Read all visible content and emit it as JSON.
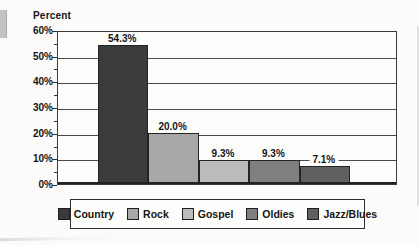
{
  "chart_data": {
    "type": "bar",
    "title": "Percent",
    "categories": [
      "Country",
      "Rock",
      "Gospel",
      "Oldies",
      "Jazz/Blues"
    ],
    "values": [
      54.3,
      20.0,
      9.3,
      9.3,
      7.1
    ],
    "bar_labels": [
      "54.3%",
      "20.0%",
      "9.3%",
      "9.3%",
      "7.1%"
    ],
    "bar_colors": [
      "#3b3b3b",
      "#a8a8a8",
      "#bcbcbc",
      "#7f7f7f",
      "#606060"
    ],
    "xlabel": "",
    "ylabel": "Percent",
    "ylim": [
      0,
      60
    ],
    "y_ticks": [
      {
        "value": 0,
        "label": "0%"
      },
      {
        "value": 10,
        "label": "10%"
      },
      {
        "value": 20,
        "label": "20%"
      },
      {
        "value": 30,
        "label": "30%"
      },
      {
        "value": 40,
        "label": "40%"
      },
      {
        "value": 50,
        "label": "50%"
      },
      {
        "value": 60,
        "label": "60%"
      }
    ],
    "minor_tick_values": [
      5,
      15,
      25,
      35,
      45,
      55
    ],
    "grid": true,
    "legend_position": "bottom",
    "legend": [
      {
        "label": "Country",
        "color": "#3b3b3b"
      },
      {
        "label": "Rock",
        "color": "#a8a8a8"
      },
      {
        "label": "Gospel",
        "color": "#bcbcbc"
      },
      {
        "label": "Oldies",
        "color": "#7f7f7f"
      },
      {
        "label": "Jazz/Blues",
        "color": "#606060"
      }
    ]
  }
}
